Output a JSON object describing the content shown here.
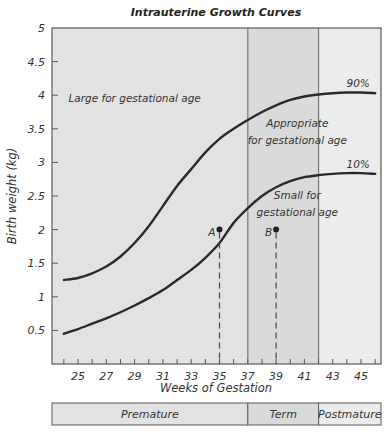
{
  "chart_data": {
    "type": "line",
    "title": "Intrauterine Growth Curves",
    "xlabel": "Weeks of Gestation",
    "ylabel": "Birth weight (kg)",
    "xlim": [
      21.5,
      46.8
    ],
    "ylim": [
      0,
      5
    ],
    "x_ticks": [
      25,
      27,
      29,
      31,
      33,
      35,
      37,
      39,
      41,
      43,
      45
    ],
    "x_minor_ticks": [
      24,
      25,
      26,
      27,
      28,
      29,
      30,
      31,
      32,
      33,
      34,
      35,
      36,
      37,
      38,
      39,
      40,
      41,
      42,
      43,
      44,
      45,
      46
    ],
    "y_ticks": [
      0.5,
      1,
      1.5,
      2,
      2.5,
      3,
      3.5,
      4,
      4.5,
      5
    ],
    "y_tick_labels": [
      "0.5",
      "1",
      "1.5",
      "2",
      "2.5",
      "3",
      "3.5",
      "4",
      "4.5",
      "5"
    ],
    "grid": false,
    "series": [
      {
        "name": "90%",
        "x": [
          24,
          25,
          26,
          27,
          28,
          29,
          30,
          31,
          32,
          33,
          34,
          35,
          36,
          37,
          38,
          39,
          40,
          41,
          42,
          43,
          44,
          45,
          46
        ],
        "y": [
          1.25,
          1.28,
          1.35,
          1.45,
          1.6,
          1.8,
          2.05,
          2.35,
          2.65,
          2.9,
          3.15,
          3.35,
          3.5,
          3.63,
          3.75,
          3.85,
          3.93,
          3.98,
          4.01,
          4.03,
          4.04,
          4.04,
          4.03
        ]
      },
      {
        "name": "10%",
        "x": [
          24,
          25,
          26,
          27,
          28,
          29,
          30,
          31,
          32,
          33,
          34,
          35,
          36,
          37,
          38,
          39,
          40,
          41,
          42,
          43,
          44,
          45,
          46
        ],
        "y": [
          0.45,
          0.52,
          0.6,
          0.68,
          0.77,
          0.87,
          0.98,
          1.1,
          1.25,
          1.4,
          1.58,
          1.8,
          2.1,
          2.32,
          2.5,
          2.63,
          2.72,
          2.78,
          2.81,
          2.83,
          2.84,
          2.84,
          2.83
        ]
      }
    ],
    "points": [
      {
        "label": "A",
        "x": 35,
        "y": 2.0
      },
      {
        "label": "B",
        "x": 39,
        "y": 2.0
      }
    ],
    "vertical_lines": [
      37,
      42
    ],
    "regions": [
      {
        "label": "Premature",
        "from": 21.5,
        "to": 37
      },
      {
        "label": "Term",
        "from": 37,
        "to": 42
      },
      {
        "label": "Postmature",
        "from": 42,
        "to": 46.8
      }
    ],
    "annotations": [
      {
        "text": "Large for gestational age",
        "x": 29,
        "y": 3.9
      },
      {
        "text": "Appropriate",
        "x": 40.5,
        "y": 3.52
      },
      {
        "text": "for gestational age",
        "x": 40.5,
        "y": 3.28
      },
      {
        "text": "Small for",
        "x": 40.5,
        "y": 2.45
      },
      {
        "text": "gestational age",
        "x": 40.5,
        "y": 2.2
      },
      {
        "text": "90%",
        "x": 44.8,
        "y": 4.12
      },
      {
        "text": "10%",
        "x": 44.8,
        "y": 2.92
      }
    ],
    "colors": {
      "premature_bg": "#e2e2e2",
      "term_bg": "#dadada",
      "postmature_bg": "#ececec",
      "curve": "#2a2a2a",
      "frame": "#666666"
    }
  }
}
